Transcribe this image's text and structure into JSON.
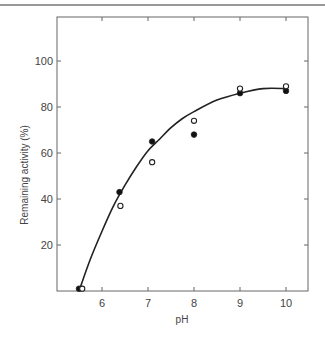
{
  "chart_data": {
    "type": "scatter",
    "title": "",
    "xlabel": "pH",
    "ylabel": "Remaining activity (%)",
    "xlim": [
      5.02,
      10.48
    ],
    "ylim": [
      0,
      119
    ],
    "x_ticks": [
      6,
      7,
      8,
      9,
      10
    ],
    "y_ticks": [
      20,
      40,
      60,
      80,
      100
    ],
    "grid": false,
    "legend": null,
    "series": [
      {
        "name": "filled circles",
        "marker": "filled-circle",
        "x": [
          5.5,
          6.38,
          7.09,
          8.0,
          9.0,
          10.0
        ],
        "y": [
          1,
          43,
          65,
          68,
          86,
          87
        ]
      },
      {
        "name": "open circles",
        "marker": "open-circle",
        "x": [
          5.57,
          6.4,
          7.09,
          8.0,
          9.0,
          10.0
        ],
        "y": [
          1,
          37,
          56,
          74,
          88,
          89
        ]
      },
      {
        "name": "fitted curve",
        "marker": "line",
        "x": [
          5.5,
          5.75,
          6.0,
          6.25,
          6.5,
          6.75,
          7.0,
          7.25,
          7.5,
          7.75,
          8.0,
          8.5,
          9.0,
          9.5,
          10.0
        ],
        "y": [
          0,
          14,
          26,
          37,
          46,
          54,
          61,
          66,
          71,
          75,
          78,
          83,
          86,
          88,
          88
        ]
      }
    ]
  }
}
